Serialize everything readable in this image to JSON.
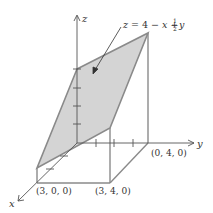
{
  "figure": {
    "equation": {
      "lhs": "z",
      "eq": " = 4 − ",
      "x": "x",
      "plus": " + ",
      "frac_num": "1",
      "frac_den": "2",
      "y": "y"
    },
    "axes": {
      "x_label": "x",
      "y_label": "y",
      "z_label": "z"
    },
    "points": [
      {
        "label": "(3, 0, 0)"
      },
      {
        "label": "(3, 4, 0)"
      },
      {
        "label": "(0, 4, 0)"
      }
    ],
    "colors": {
      "plane_fill": "#d3d3d3",
      "edge": "#888888",
      "axis": "#555555"
    }
  }
}
